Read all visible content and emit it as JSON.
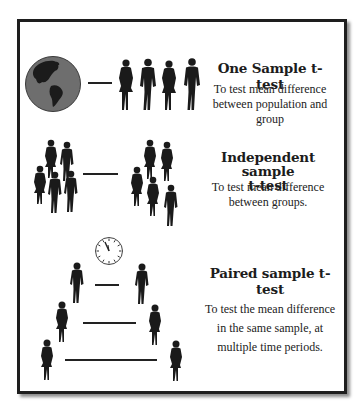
{
  "sections": [
    {
      "id": "one-sample",
      "title": "One Sample t-test",
      "description_lines": [
        "To test mean difference",
        "between population and",
        "group"
      ],
      "left_icon": "globe-icon",
      "right_icon": "group-of-four-people-icon"
    },
    {
      "id": "independent-sample",
      "title_lines": [
        "Independent sample",
        "t-test"
      ],
      "description_lines": [
        "To test mean difference",
        "between groups."
      ],
      "left_icon": "group-a-people-icon",
      "right_icon": "group-b-people-icon"
    },
    {
      "id": "paired-sample",
      "title": "Paired sample t-test",
      "description_lines": [
        "To test the mean difference",
        "in the same sample, at",
        "multiple time periods."
      ],
      "top_icon": "clock-icon",
      "pair_icons": "person-pairs-over-time-icon"
    }
  ],
  "colors": {
    "frame": "#1e1e1e",
    "silhouette": "#1a1a1a",
    "globe_ocean": "#6b6b6b",
    "text": "#1c1c1c"
  }
}
